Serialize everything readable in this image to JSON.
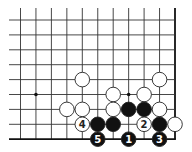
{
  "board": {
    "title": "Go board corner diagram",
    "columns": 11,
    "rows": 9,
    "origin_x": 20.5,
    "origin_y": 20,
    "spacing_x": 15.45,
    "spacing_y": 14.9,
    "line_start_x": 9,
    "line_start_y": 8,
    "right_edge": true,
    "bottom_edge": true,
    "line_color": "#333333",
    "edge_color": "#111111",
    "stone_radius": 7.3,
    "black_color": "#111111",
    "white_color": "#ffffff",
    "star_points": [
      {
        "col": 1,
        "row": 5
      },
      {
        "col": 7,
        "row": 5
      }
    ],
    "stones": [
      {
        "color": "white",
        "col": 4,
        "row": 4,
        "label": ""
      },
      {
        "color": "white",
        "col": 9,
        "row": 4,
        "label": ""
      },
      {
        "color": "white",
        "col": 6,
        "row": 5,
        "label": ""
      },
      {
        "color": "white",
        "col": 8,
        "row": 5,
        "label": ""
      },
      {
        "color": "white",
        "col": 3,
        "row": 6,
        "label": ""
      },
      {
        "color": "white",
        "col": 4,
        "row": 6,
        "label": ""
      },
      {
        "color": "white",
        "col": 6,
        "row": 6,
        "label": ""
      },
      {
        "color": "black",
        "col": 7,
        "row": 6,
        "label": ""
      },
      {
        "color": "black",
        "col": 8,
        "row": 6,
        "label": ""
      },
      {
        "color": "white",
        "col": 9,
        "row": 6,
        "label": ""
      },
      {
        "color": "white",
        "col": 4,
        "row": 7,
        "label": "4"
      },
      {
        "color": "black",
        "col": 5,
        "row": 7,
        "label": ""
      },
      {
        "color": "black",
        "col": 6,
        "row": 7,
        "label": ""
      },
      {
        "color": "white",
        "col": 8,
        "row": 7,
        "label": "2"
      },
      {
        "color": "black",
        "col": 9,
        "row": 7,
        "label": ""
      },
      {
        "color": "white",
        "col": 10,
        "row": 7,
        "label": ""
      },
      {
        "color": "black",
        "col": 5,
        "row": 8,
        "label": "5"
      },
      {
        "color": "black",
        "col": 7,
        "row": 8,
        "label": "1"
      },
      {
        "color": "black",
        "col": 9,
        "row": 8,
        "label": "3"
      }
    ]
  }
}
